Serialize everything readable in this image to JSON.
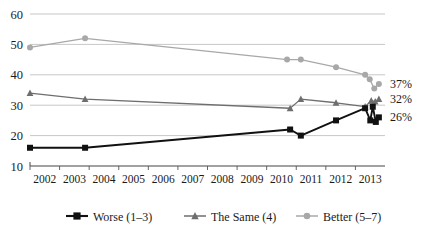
{
  "chart_data": {
    "type": "line",
    "title": "",
    "xlabel": "",
    "ylabel": "",
    "xlim": [
      2002,
      2013.6
    ],
    "ylim": [
      10,
      60
    ],
    "grid": true,
    "legend_position": "bottom",
    "y_ticks": [
      "60",
      "50",
      "40",
      "30",
      "20",
      "10"
    ],
    "y_tick_values": [
      60,
      50,
      40,
      30,
      20,
      10
    ],
    "x_ticks": [
      "2002",
      "2003",
      "2004",
      "2005",
      "2006",
      "2007",
      "2008",
      "2009",
      "2010",
      "2011",
      "2012",
      "2013"
    ],
    "x_tick_values": [
      2002,
      2003,
      2004,
      2005,
      2006,
      2007,
      2008,
      2009,
      2010,
      2011,
      2012,
      2013
    ],
    "series": [
      {
        "name": "Worse (1–3)",
        "color": "#111111",
        "marker": "square",
        "x": [
          2002.0,
          2003.8,
          2010.5,
          2010.85,
          2012.0,
          2012.95,
          2013.12,
          2013.2,
          2013.3,
          2013.4
        ],
        "values": [
          16,
          16,
          22,
          20,
          25,
          29,
          25,
          29.5,
          24.5,
          26
        ]
      },
      {
        "name": "The Same (4)",
        "color": "#6e6e6e",
        "marker": "triangle",
        "x": [
          2002.0,
          2003.8,
          2010.5,
          2010.85,
          2012.0,
          2012.95,
          2013.15,
          2013.28,
          2013.4
        ],
        "values": [
          34,
          32,
          29,
          32,
          30.8,
          29.5,
          31.5,
          31.2,
          32
        ]
      },
      {
        "name": "Better (5–7)",
        "color": "#a8a8a8",
        "marker": "circle",
        "x": [
          2002.0,
          2003.8,
          2010.4,
          2010.85,
          2012.0,
          2012.95,
          2013.1,
          2013.25,
          2013.4
        ],
        "values": [
          49,
          52,
          45,
          45,
          42.5,
          40,
          38.5,
          35.5,
          37
        ]
      }
    ],
    "end_labels": [
      {
        "text": "37%",
        "series": "Better (5–7)",
        "value": 37
      },
      {
        "text": "32%",
        "series": "The Same (4)",
        "value": 32
      },
      {
        "text": "26%",
        "series": "Worse (1–3)",
        "value": 26
      }
    ]
  },
  "legend": {
    "items": [
      {
        "label": "Worse (1–3)",
        "color": "#111111",
        "marker": "square"
      },
      {
        "label": "The Same (4)",
        "color": "#6e6e6e",
        "marker": "triangle"
      },
      {
        "label": "Better (5–7)",
        "color": "#a8a8a8",
        "marker": "circle"
      }
    ]
  },
  "colors": {
    "grid": "#b9b9b9",
    "axis": "#555555",
    "background": "#ffffff"
  }
}
